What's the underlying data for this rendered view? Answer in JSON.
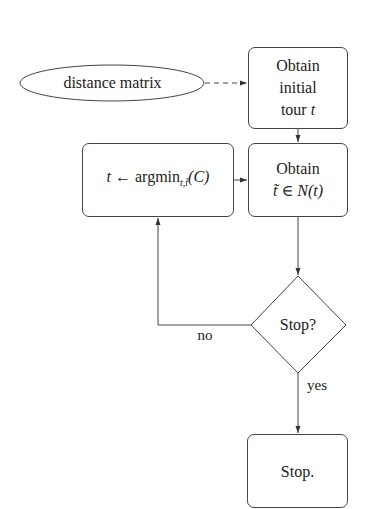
{
  "diagram": {
    "type": "flowchart",
    "nodes": {
      "input": {
        "shape": "ellipse",
        "label": "distance matrix"
      },
      "init": {
        "shape": "rounded-rect",
        "line1": "Obtain",
        "line2": "initial",
        "line3_text": "tour ",
        "line3_var": "t"
      },
      "update": {
        "shape": "rounded-rect",
        "var_t": "t",
        "arrow": "←",
        "func": "argmin",
        "subscript": "t,t̃",
        "arg": "(C)"
      },
      "neighbor": {
        "shape": "rounded-rect",
        "line1": "Obtain",
        "var_tt": "t̃",
        "in": "∈",
        "set": "N(t)"
      },
      "decision": {
        "shape": "diamond",
        "label": "Stop?"
      },
      "end": {
        "shape": "rounded-rect",
        "label": "Stop."
      }
    },
    "edges": [
      {
        "from": "input",
        "to": "init",
        "style": "dashed"
      },
      {
        "from": "init",
        "to": "neighbor",
        "style": "solid"
      },
      {
        "from": "neighbor",
        "to": "decision",
        "style": "solid"
      },
      {
        "from": "decision",
        "to": "update",
        "style": "solid",
        "label": "no"
      },
      {
        "from": "update",
        "to": "neighbor",
        "style": "solid"
      },
      {
        "from": "decision",
        "to": "end",
        "style": "solid",
        "label": "yes"
      }
    ],
    "edge_labels": {
      "no": "no",
      "yes": "yes"
    },
    "colors": {
      "stroke": "#444444",
      "background": "#ffffff",
      "text": "#222222"
    }
  }
}
